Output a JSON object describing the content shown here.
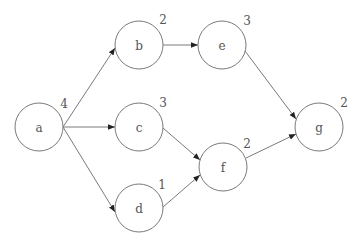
{
  "diagram": {
    "type": "directed-graph",
    "nodes": [
      {
        "id": "a",
        "label": "a",
        "weight": "4",
        "cx": 39,
        "cy": 127
      },
      {
        "id": "b",
        "label": "b",
        "weight": "2",
        "cx": 139,
        "cy": 45
      },
      {
        "id": "c",
        "label": "c",
        "weight": "3",
        "cx": 139,
        "cy": 127
      },
      {
        "id": "d",
        "label": "d",
        "weight": "1",
        "cx": 139,
        "cy": 208
      },
      {
        "id": "e",
        "label": "e",
        "weight": "3",
        "cx": 222,
        "cy": 45
      },
      {
        "id": "f",
        "label": "f",
        "weight": "2",
        "cx": 223,
        "cy": 167
      },
      {
        "id": "g",
        "label": "g",
        "weight": "2",
        "cx": 319,
        "cy": 127
      }
    ],
    "edges": [
      {
        "from": "a",
        "to": "b"
      },
      {
        "from": "a",
        "to": "c"
      },
      {
        "from": "a",
        "to": "d"
      },
      {
        "from": "b",
        "to": "e"
      },
      {
        "from": "c",
        "to": "f"
      },
      {
        "from": "d",
        "to": "f"
      },
      {
        "from": "e",
        "to": "g"
      },
      {
        "from": "f",
        "to": "g"
      }
    ]
  }
}
